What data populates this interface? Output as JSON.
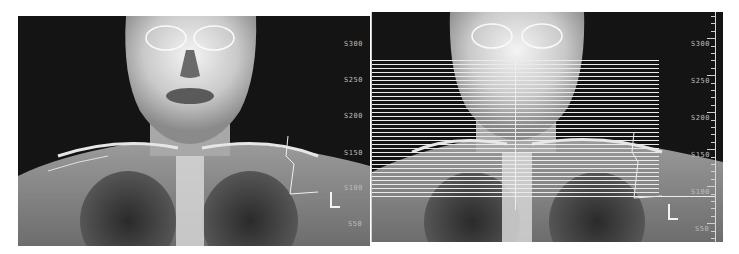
{
  "viewer": {
    "panels": [
      {
        "id": "left",
        "description": "Frontal scout (topogram) — head, neck and upper chest",
        "axis_labels": [
          "S300",
          "S250",
          "S200",
          "S150",
          "S100",
          "S50"
        ],
        "laterality_marker": "L"
      },
      {
        "id": "right",
        "description": "Frontal scout with planned axial slice lines overlaid",
        "axis_labels": [
          "S300",
          "S250",
          "S200",
          "S150",
          "S100",
          "S50"
        ],
        "laterality_marker": "L",
        "slice_lines": {
          "count": 35,
          "color": "#ebebeb"
        }
      }
    ]
  },
  "colors": {
    "background": "#ffffff",
    "panel": "#141414",
    "label": "#bdbdbd",
    "overlay": "#ebebeb"
  }
}
